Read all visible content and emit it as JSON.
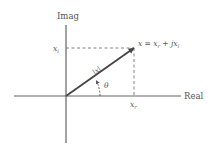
{
  "diagram": {
    "axes": {
      "horizontal_label": "Real",
      "vertical_label": "Imag"
    },
    "labels": {
      "point_equation": "x = x",
      "point_equation_r_sub": "r",
      "point_equation_plus": " + jx",
      "point_equation_i_sub": "i",
      "imag_tick_main": "x",
      "imag_tick_sub": "i",
      "real_tick_main": "x",
      "real_tick_sub": "r",
      "magnitude": "|x|",
      "angle": "θ"
    },
    "geometry": {
      "origin": [
        66,
        96
      ],
      "point": [
        134,
        48
      ],
      "real_axis_x_range": [
        14,
        181
      ],
      "imag_axis_y_range": [
        25,
        143
      ]
    },
    "colors": {
      "axis": "#666666",
      "vector": "#444444",
      "dashed": "#777777",
      "text": "#555555"
    }
  }
}
